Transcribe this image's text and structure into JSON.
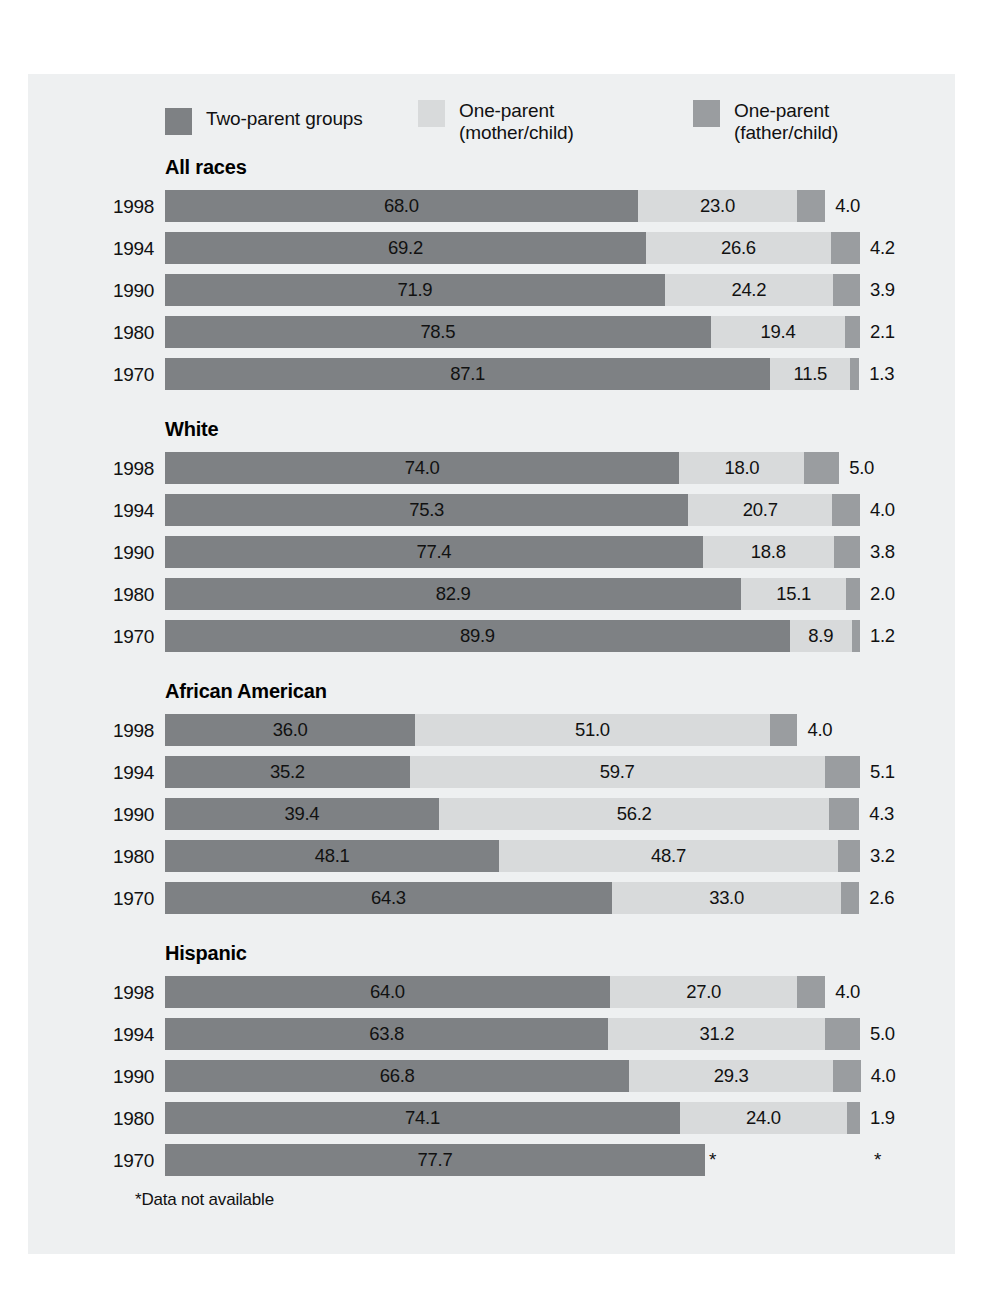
{
  "figure": {
    "background_color": "#eef0f1",
    "footnote": "*Data not available"
  },
  "legend": {
    "items": [
      {
        "label": "Two-parent groups",
        "color": "#7e8184",
        "key": "two_parent"
      },
      {
        "label": "One-parent\n(mother/child)",
        "color": "#d8dadb",
        "key": "mother_child"
      },
      {
        "label": "One-parent\n(father/child)",
        "color": "#9a9da0",
        "key": "father_child"
      }
    ]
  },
  "chart_data": {
    "type": "bar",
    "orientation": "horizontal",
    "stacked": true,
    "title": "",
    "xlabel": "",
    "ylabel": "",
    "xlim": [
      0,
      100
    ],
    "grid": false,
    "legend_position": "top",
    "series": [
      {
        "name": "Two-parent groups",
        "color": "#7e8184"
      },
      {
        "name": "One-parent (mother/child)",
        "color": "#d8dadb"
      },
      {
        "name": "One-parent (father/child)",
        "color": "#9a9da0"
      }
    ],
    "groups": [
      {
        "name": "All races",
        "rows": [
          {
            "year": "1998",
            "values": [
              68.0,
              23.0,
              4.0
            ],
            "labels": [
              "68.0",
              "23.0",
              "4.0"
            ]
          },
          {
            "year": "1994",
            "values": [
              69.2,
              26.6,
              4.2
            ],
            "labels": [
              "69.2",
              "26.6",
              "4.2"
            ]
          },
          {
            "year": "1990",
            "values": [
              71.9,
              24.2,
              3.9
            ],
            "labels": [
              "71.9",
              "24.2",
              "3.9"
            ]
          },
          {
            "year": "1980",
            "values": [
              78.5,
              19.4,
              2.1
            ],
            "labels": [
              "78.5",
              "19.4",
              "2.1"
            ]
          },
          {
            "year": "1970",
            "values": [
              87.1,
              11.5,
              1.3
            ],
            "labels": [
              "87.1",
              "11.5",
              "1.3"
            ]
          }
        ]
      },
      {
        "name": "White",
        "rows": [
          {
            "year": "1998",
            "values": [
              74.0,
              18.0,
              5.0
            ],
            "labels": [
              "74.0",
              "18.0",
              "5.0"
            ]
          },
          {
            "year": "1994",
            "values": [
              75.3,
              20.7,
              4.0
            ],
            "labels": [
              "75.3",
              "20.7",
              "4.0"
            ]
          },
          {
            "year": "1990",
            "values": [
              77.4,
              18.8,
              3.8
            ],
            "labels": [
              "77.4",
              "18.8",
              "3.8"
            ]
          },
          {
            "year": "1980",
            "values": [
              82.9,
              15.1,
              2.0
            ],
            "labels": [
              "82.9",
              "15.1",
              "2.0"
            ]
          },
          {
            "year": "1970",
            "values": [
              89.9,
              8.9,
              1.2
            ],
            "labels": [
              "89.9",
              "8.9",
              "1.2"
            ]
          }
        ]
      },
      {
        "name": "African American",
        "rows": [
          {
            "year": "1998",
            "values": [
              36.0,
              51.0,
              4.0
            ],
            "labels": [
              "36.0",
              "51.0",
              "4.0"
            ]
          },
          {
            "year": "1994",
            "values": [
              35.2,
              59.7,
              5.1
            ],
            "labels": [
              "35.2",
              "59.7",
              "5.1"
            ]
          },
          {
            "year": "1990",
            "values": [
              39.4,
              56.2,
              4.3
            ],
            "labels": [
              "39.4",
              "56.2",
              "4.3"
            ]
          },
          {
            "year": "1980",
            "values": [
              48.1,
              48.7,
              3.2
            ],
            "labels": [
              "48.1",
              "48.7",
              "3.2"
            ]
          },
          {
            "year": "1970",
            "values": [
              64.3,
              33.0,
              2.6
            ],
            "labels": [
              "64.3",
              "33.0",
              "2.6"
            ]
          }
        ]
      },
      {
        "name": "Hispanic",
        "rows": [
          {
            "year": "1998",
            "values": [
              64.0,
              27.0,
              4.0
            ],
            "labels": [
              "64.0",
              "27.0",
              "4.0"
            ]
          },
          {
            "year": "1994",
            "values": [
              63.8,
              31.2,
              5.0
            ],
            "labels": [
              "63.8",
              "31.2",
              "5.0"
            ]
          },
          {
            "year": "1990",
            "values": [
              66.8,
              29.3,
              4.0
            ],
            "labels": [
              "66.8",
              "29.3",
              "4.0"
            ]
          },
          {
            "year": "1980",
            "values": [
              74.1,
              24.0,
              1.9
            ],
            "labels": [
              "74.1",
              "24.0",
              "1.9"
            ]
          },
          {
            "year": "1970",
            "values": [
              77.7,
              null,
              null
            ],
            "labels": [
              "77.7",
              "*",
              "*"
            ]
          }
        ]
      }
    ]
  }
}
